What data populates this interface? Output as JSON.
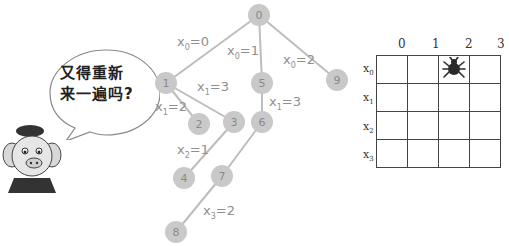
{
  "speech_bubble": {
    "line1": "又得重新",
    "line2": "来一遍吗?"
  },
  "character": {
    "icon": "pig-character-icon"
  },
  "tree": {
    "node_color": "#c9c9c9",
    "edge_color": "#bdbdbd",
    "nodes": [
      {
        "id": "0",
        "x": 259,
        "y": 15
      },
      {
        "id": "1",
        "x": 166,
        "y": 83
      },
      {
        "id": "5",
        "x": 262,
        "y": 83
      },
      {
        "id": "9",
        "x": 337,
        "y": 80
      },
      {
        "id": "2",
        "x": 199,
        "y": 124
      },
      {
        "id": "3",
        "x": 234,
        "y": 122
      },
      {
        "id": "6",
        "x": 262,
        "y": 122
      },
      {
        "id": "4",
        "x": 184,
        "y": 178
      },
      {
        "id": "7",
        "x": 222,
        "y": 176
      },
      {
        "id": "8",
        "x": 176,
        "y": 232
      }
    ],
    "edges": [
      {
        "from": "0",
        "to": "1",
        "var": "x",
        "sub": "0",
        "value": "=0",
        "lx": 177,
        "ly": 46
      },
      {
        "from": "0",
        "to": "5",
        "var": "x",
        "sub": "0",
        "value": "=1",
        "lx": 227,
        "ly": 55
      },
      {
        "from": "0",
        "to": "9",
        "var": "x",
        "sub": "0",
        "value": "=2",
        "lx": 283,
        "ly": 64
      },
      {
        "from": "1",
        "to": "2",
        "var": "x",
        "sub": "1",
        "value": "=2",
        "lx": 155,
        "ly": 111
      },
      {
        "from": "1",
        "to": "3",
        "var": "x",
        "sub": "1",
        "value": "=3",
        "lx": 197,
        "ly": 91
      },
      {
        "from": "5",
        "to": "6",
        "var": "x",
        "sub": "1",
        "value": "=3",
        "lx": 269,
        "ly": 106
      },
      {
        "from": "3",
        "to": "4",
        "var": "x",
        "sub": "2",
        "value": "=1",
        "lx": 177,
        "ly": 154
      },
      {
        "from": "6",
        "to": "7",
        "var": "x",
        "sub": "",
        "value": "",
        "lx": 0,
        "ly": 0
      },
      {
        "from": "7",
        "to": "8",
        "var": "x",
        "sub": "3",
        "value": "=2",
        "lx": 203,
        "ly": 215
      }
    ]
  },
  "board": {
    "columns": [
      "0",
      "1",
      "2",
      "3"
    ],
    "rows": [
      {
        "var": "x",
        "sub": "0"
      },
      {
        "var": "x",
        "sub": "1"
      },
      {
        "var": "x",
        "sub": "2"
      },
      {
        "var": "x",
        "sub": "3"
      }
    ],
    "queen_position": {
      "row": 0,
      "col": 2
    },
    "queen_icon": "spider-icon",
    "queen_color": "#2a2a2a"
  }
}
